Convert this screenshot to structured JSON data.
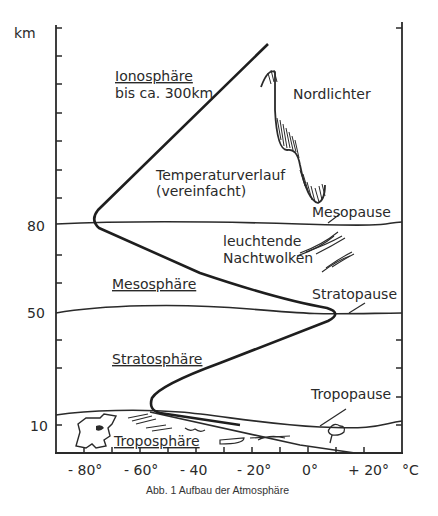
{
  "diagram": {
    "y_unit": "km",
    "x_unit": "°C",
    "y_tick_labels": [
      {
        "label": "80",
        "value": 80
      },
      {
        "label": "50",
        "value": 50
      },
      {
        "label": "10",
        "value": 10
      }
    ],
    "x_tick_labels": [
      {
        "label": "- 80°",
        "value": -80
      },
      {
        "label": "- 60°",
        "value": -60
      },
      {
        "label": "- 40",
        "value": -40
      },
      {
        "label": "- 20°",
        "value": -20
      },
      {
        "label": "0°",
        "value": 0
      },
      {
        "label": "+ 20°",
        "value": 20
      }
    ],
    "layers": {
      "ionosphere": {
        "name": "Ionosphäre",
        "note": "bis ca. 300km"
      },
      "mesosphere": {
        "name": "Mesosphäre"
      },
      "stratosphere": {
        "name": "Stratosphäre"
      },
      "troposphere": {
        "name": "Troposphäre"
      }
    },
    "boundaries": {
      "mesopause": "Mesopause",
      "stratopause": "Stratopause",
      "tropopause": "Tropopause"
    },
    "annotations": {
      "temperature_curve_line1": "Temperaturverlauf",
      "temperature_curve_line2": "(vereinfacht)",
      "aurora": "Nordlichter",
      "noctilucent_line1": "leuchtende",
      "noctilucent_line2": "Nachtwolken"
    },
    "caption": "Abb. 1 Aufbau der Atmosphäre"
  }
}
